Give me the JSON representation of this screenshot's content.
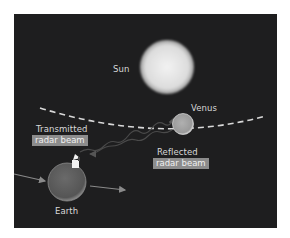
{
  "diagram": {
    "labels": {
      "sun": "Sun",
      "venus": "Venus",
      "earth": "Earth",
      "transmitted_line1": "Transmitted",
      "transmitted_line2": "radar beam",
      "reflected_line1": "Reflected",
      "reflected_line2": "radar beam"
    },
    "colors": {
      "background": "#1e1e1f",
      "sun": "#e6e6e6",
      "venus": "#a8a8a8",
      "earth": "#5a5a5a",
      "orbit": "#d8d8d8",
      "label_box": "#8c8c8c"
    },
    "icons": {
      "radar": "radar-dish-icon"
    }
  }
}
